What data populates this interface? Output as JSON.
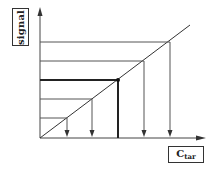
{
  "diagram": {
    "y_axis_label": "signal",
    "x_axis_label_main": "C",
    "x_axis_label_sub": "tar",
    "colors": {
      "line": "#444444",
      "bold_line": "#222222",
      "background": "#ffffff"
    },
    "calibration_levels": [
      {
        "signal_y": 118,
        "conc_x": 67,
        "arrow": true,
        "bold": false
      },
      {
        "signal_y": 99,
        "conc_x": 92,
        "arrow": true,
        "bold": false
      },
      {
        "signal_y": 80,
        "conc_x": 118,
        "arrow": false,
        "bold": true,
        "marked_point": true
      },
      {
        "signal_y": 61,
        "conc_x": 144,
        "arrow": true,
        "bold": false
      },
      {
        "signal_y": 42,
        "conc_x": 170,
        "arrow": true,
        "bold": false
      }
    ]
  }
}
